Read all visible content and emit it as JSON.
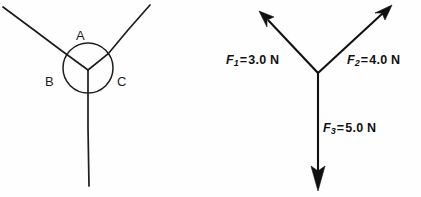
{
  "figure": {
    "background_color": "#fefefe",
    "ink_color": "#111111",
    "width": 421,
    "height": 197
  },
  "left_panel": {
    "name": "angle-regions-diagram",
    "description": "Three rays meeting at a common vertex with a circle marking three angle regions",
    "zone_labels": [
      {
        "id": "A",
        "text": "A",
        "position": "top",
        "x": 76,
        "y": 29
      },
      {
        "id": "B",
        "text": "B",
        "position": "lower-left",
        "x": 45,
        "y": 75
      },
      {
        "id": "C",
        "text": "C",
        "position": "lower-right",
        "x": 117,
        "y": 75
      }
    ],
    "vertex": {
      "x": 88,
      "y": 70
    },
    "circle": {
      "cx": 88,
      "cy": 68,
      "r": 25
    },
    "rays": [
      {
        "id": "ray-upper-left",
        "to_x": 3,
        "to_y": 7
      },
      {
        "id": "ray-upper-right",
        "to_x": 150,
        "to_y": 5
      },
      {
        "id": "ray-down",
        "to_x": 89,
        "to_y": 186
      }
    ]
  },
  "right_panel": {
    "name": "force-vector-diagram",
    "description": "Three force vectors drawn from a common origin with magnitude labels",
    "vertex": {
      "x": 108,
      "y": 73
    },
    "vectors": [
      {
        "id": "F1",
        "symbol": "F",
        "subscript": "1",
        "relation": "=",
        "magnitude": "3.0",
        "unit": "N",
        "label_text": "F1 = 3.0 N",
        "direction": "upper-left",
        "tip_x": 51,
        "tip_y": 14,
        "label_x": 16,
        "label_y": 54
      },
      {
        "id": "F2",
        "symbol": "F",
        "subscript": "2",
        "relation": "=",
        "magnitude": "4.0",
        "unit": "N",
        "label_text": "F2 = 4.0 N",
        "direction": "upper-right",
        "tip_x": 180,
        "tip_y": 6,
        "label_x": 137,
        "label_y": 54
      },
      {
        "id": "F3",
        "symbol": "F",
        "subscript": "3",
        "relation": "=",
        "magnitude": "5.0",
        "unit": "N",
        "label_text": "F3 = 5.0 N",
        "direction": "down",
        "tip_x": 108,
        "tip_y": 190,
        "label_x": 113,
        "label_y": 122
      }
    ]
  }
}
